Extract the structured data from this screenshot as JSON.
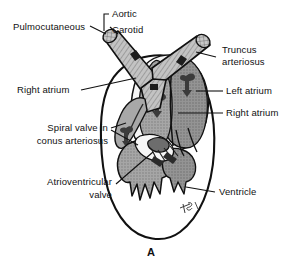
{
  "figure": {
    "title_letter": "A",
    "signature": "artist-signature"
  },
  "labels": {
    "pulmocutaneous": "Pulmocutaneous",
    "aortic": "Aortic",
    "carotid": "Carotid",
    "truncus_arteriosus_l1": "Truncus",
    "truncus_arteriosus_l2": "arteriosus",
    "right_atrium_left": "Right atrium",
    "left_atrium": "Left atrium",
    "right_atrium_right": "Right atrium",
    "spiral_valve_l1": "Spiral valve in",
    "spiral_valve_l2": "conus arteriosus",
    "atrioventricular_l1": "Atrioventricular",
    "atrioventricular_l2": "valve",
    "ventricle": "Ventricle"
  },
  "colors": {
    "ink": "#111111",
    "background": "#ffffff",
    "vessel_fill": "#b9b9b9",
    "atrium_fill": "#8f8f8f",
    "atrium_dark": "#6f6f6f",
    "ventricle_fill": "#9a9a9a",
    "ventricle_dark": "#7a7a7a",
    "conus_fill": "#a8a8a8",
    "pale_fill": "#f2f2f2"
  }
}
